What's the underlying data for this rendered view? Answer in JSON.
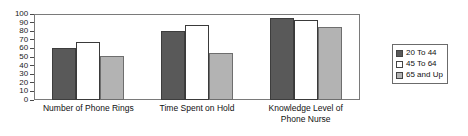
{
  "chart_data": {
    "type": "bar",
    "title": "",
    "xlabel": "",
    "ylabel": "",
    "ylim": [
      0,
      100
    ],
    "yticks": [
      0,
      10,
      20,
      30,
      40,
      50,
      60,
      70,
      80,
      90,
      100
    ],
    "ytick_labels": [
      "0",
      "10",
      "20",
      "30",
      "40",
      "50",
      "60",
      "70",
      "80",
      "90",
      "100"
    ],
    "grid": false,
    "legend_position": "right",
    "categories": [
      "Number of Phone Rings",
      "Time Spent on Hold",
      "Knowledge Level of\nPhone Nurse"
    ],
    "series": [
      {
        "name": "20 To 44",
        "color": "#595959",
        "values": [
          61,
          80,
          95
        ]
      },
      {
        "name": "45 To 64",
        "color": "#ffffff",
        "values": [
          68,
          87,
          93
        ]
      },
      {
        "name": "65 and Up",
        "color": "#b3b3b3",
        "values": [
          51,
          55,
          85
        ]
      }
    ]
  },
  "legend": {
    "items": [
      {
        "label": "20 To 44",
        "swatch": "dark-gray-swatch"
      },
      {
        "label": "45 To 64",
        "swatch": "white-swatch"
      },
      {
        "label": "65 and Up",
        "swatch": "light-gray-swatch"
      }
    ]
  }
}
